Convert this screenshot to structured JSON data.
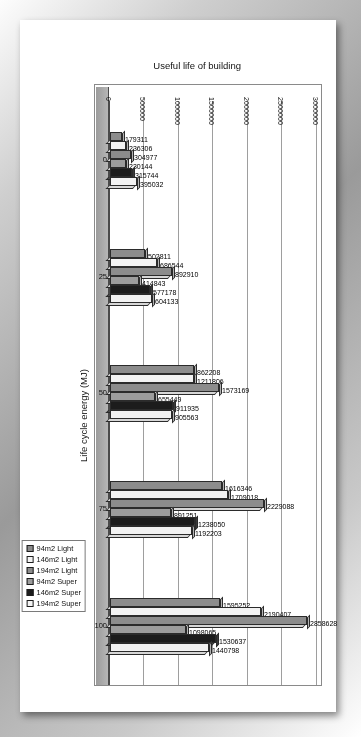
{
  "chart_data": {
    "type": "bar",
    "title": "",
    "xlabel": "Useful life of building",
    "ylabel": "Life cycle energy (MJ)",
    "categories": [
      "0",
      "25",
      "50",
      "75",
      "100"
    ],
    "xtick_labels": [
      "0",
      "25",
      "50",
      "75",
      "100"
    ],
    "ytick_labels": [
      "0",
      "500000",
      "1000000",
      "1500000",
      "2000000",
      "2500000",
      "3000000"
    ],
    "ylim": [
      0,
      3000000
    ],
    "grid": true,
    "legend_position": "bottom-right",
    "orientation": "horizontal-3d",
    "series": [
      {
        "name": "94m2 Light",
        "color": "#8c8c8c",
        "values": [
          179311,
          502811,
          1211806,
          1616346,
          1595252
        ]
      },
      {
        "name": "146m2 Light",
        "color": "#f2f2f2",
        "values": [
          236306,
          686544,
          1211806,
          1709018,
          2190407
        ]
      },
      {
        "name": "194m2 Light",
        "color": "#8c8c8c",
        "values": [
          304977,
          892910,
          1573169,
          2229088,
          2858628
        ]
      },
      {
        "name": "94m2 Super",
        "color": "#9c9c9c",
        "values": [
          230144,
          414843,
          655449,
          891251,
          1098065
        ]
      },
      {
        "name": "146m2 Super",
        "color": "#1c1c1c",
        "values": [
          315744,
          577178,
          911935,
          1238050,
          1530637
        ]
      },
      {
        "name": "194m2 Super",
        "color": "#f2f2f2",
        "values": [
          395032,
          604133,
          905563,
          1192203,
          1440798
        ]
      }
    ],
    "data_labels": [
      [
        "179311",
        "236306",
        "304977",
        "230144",
        "315744",
        "395032"
      ],
      [
        "502811",
        "686544",
        "892910",
        "414843",
        "577178",
        "604133"
      ],
      [
        "862208",
        "1211806",
        "1573169",
        "655449",
        "911935",
        "905563"
      ],
      [
        "1616346",
        "1709018",
        "2229088",
        "891251",
        "1238050",
        "1192203"
      ],
      [
        "1595252",
        "2190407",
        "2858628",
        "1098065",
        "1530637",
        "1440798"
      ]
    ]
  },
  "legend": {
    "items": [
      {
        "label": "94m2 Light",
        "color": "#8c8c8c"
      },
      {
        "label": "146m2 Light",
        "color": "#f4f4f4"
      },
      {
        "label": "194m2 Light",
        "color": "#8c8c8c"
      },
      {
        "label": "94m2 Super",
        "color": "#9c9c9c"
      },
      {
        "label": "146m2 Super",
        "color": "#1c1c1c"
      },
      {
        "label": "194m2 Super",
        "color": "#f4f4f4"
      }
    ]
  }
}
